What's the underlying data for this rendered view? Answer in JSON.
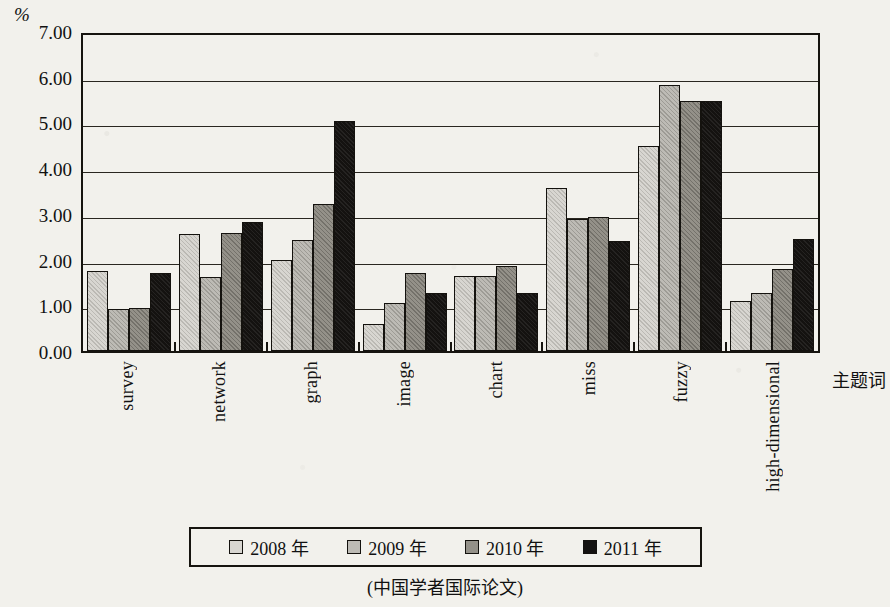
{
  "axis": {
    "unit_label": "%",
    "y_ticks": [
      "7.00",
      "6.00",
      "5.00",
      "4.00",
      "3.00",
      "2.00",
      "1.00",
      "0.00"
    ],
    "x_title": "主题词"
  },
  "legend": {
    "items": [
      {
        "label": "2008 年",
        "color": "#d8d6d1"
      },
      {
        "label": "2009 年",
        "color": "#bdbbb5"
      },
      {
        "label": "2010 年",
        "color": "#949189"
      },
      {
        "label": "2011 年",
        "color": "#141210"
      }
    ]
  },
  "caption": "(中国学者国际论文)",
  "chart_data": {
    "type": "bar",
    "title": "",
    "subtitle": "",
    "xlabel": "主题词",
    "ylabel": "%",
    "ylim": [
      0,
      7
    ],
    "ytick_step": 1,
    "grid": true,
    "legend_position": "bottom",
    "categories": [
      "survey",
      "network",
      "graph",
      "image",
      "chart",
      "miss",
      "fuzzy",
      "high-dimensional"
    ],
    "series": [
      {
        "name": "2008 年",
        "color": "#d8d6d1",
        "values": [
          1.75,
          2.57,
          2.0,
          0.6,
          1.65,
          3.57,
          4.48,
          1.1
        ]
      },
      {
        "name": "2009 年",
        "color": "#bdbbb5",
        "values": [
          0.93,
          1.62,
          2.42,
          1.05,
          1.65,
          2.88,
          5.82,
          1.26
        ]
      },
      {
        "name": "2010 年",
        "color": "#949189",
        "values": [
          0.95,
          2.59,
          3.22,
          1.7,
          1.87,
          2.93,
          5.47,
          1.79
        ]
      },
      {
        "name": "2011 年",
        "color": "#141210",
        "values": [
          1.7,
          2.83,
          5.03,
          1.27,
          1.28,
          2.4,
          5.47,
          2.44
        ]
      }
    ]
  }
}
